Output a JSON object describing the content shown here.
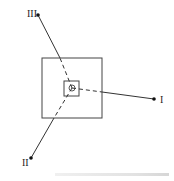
{
  "diagram": {
    "outer_square": {
      "x": 42,
      "y": 58,
      "w": 60,
      "h": 60
    },
    "inner_square": {
      "x": 64,
      "y": 81,
      "w": 15,
      "h": 15
    },
    "center_circle": {
      "cx": 72,
      "cy": 88,
      "r": 3
    },
    "center": {
      "x": 72,
      "y": 88
    },
    "branches": [
      {
        "id": "I",
        "label": "I",
        "end": {
          "x": 154,
          "y": 99
        },
        "label_pos": {
          "x": 160,
          "y": 103
        },
        "dash_end": {
          "x": 102,
          "y": 92
        }
      },
      {
        "id": "II",
        "label": "II",
        "end": {
          "x": 31,
          "y": 158
        },
        "label_pos": {
          "x": 22,
          "y": 166
        },
        "dash_end": {
          "x": 54,
          "y": 118
        }
      },
      {
        "id": "III",
        "label": "III",
        "end": {
          "x": 38,
          "y": 15
        },
        "label_pos": {
          "x": 27,
          "y": 17
        },
        "dash_end": {
          "x": 60,
          "y": 58
        }
      }
    ],
    "line_color": "#333333"
  },
  "caption": {
    "text": ""
  }
}
